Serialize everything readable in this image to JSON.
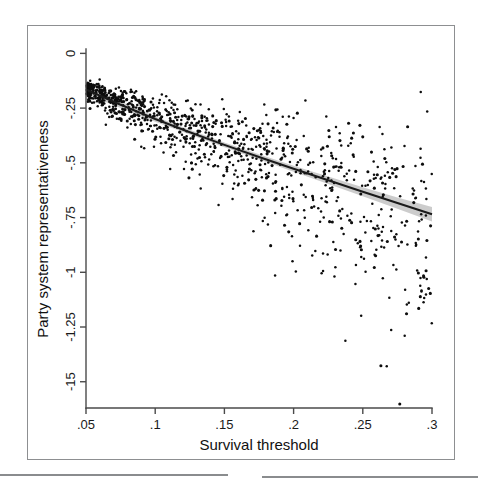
{
  "figure": {
    "kind": "scatterplot-with-fit",
    "background_color": "#ffffff",
    "frame_color": "#8d8f91",
    "point_color": "#0d0d0d",
    "fit_line_color": "#1b1b1b",
    "ci_band_color": "#b9b9b9"
  },
  "chart_data": {
    "type": "scatter",
    "title": "",
    "xlabel": "Survival threshold",
    "ylabel": "Party system representativeness",
    "xlim": [
      0.05,
      0.3
    ],
    "ylim": [
      -1.62,
      0.02
    ],
    "grid": false,
    "legend": "none",
    "xticks": [
      0.05,
      0.1,
      0.15,
      0.2,
      0.25,
      0.3
    ],
    "xticklabels": [
      ".05",
      ".1",
      ".15",
      ".2",
      ".25",
      ".3"
    ],
    "yticks": [
      0,
      -0.25,
      -0.5,
      -0.75,
      -1,
      -1.25,
      -1.5
    ],
    "yticklabels": [
      "0",
      "-.25",
      "-.5",
      "-.75",
      "-1",
      "-1.25",
      "-15"
    ],
    "n_points": 1050,
    "series": [
      {
        "name": "observations",
        "marker": "dot",
        "color": "#0d0d0d",
        "description": "Dense cloud of country-election observations; tight near x=.05 around y=-.15, fanning out downward as x increases."
      },
      {
        "name": "fitted line",
        "type": "line",
        "color": "#1b1b1b",
        "description": "Monotonically decreasing fit with 95% confidence band.",
        "x": [
          0.05,
          0.075,
          0.1,
          0.125,
          0.15,
          0.175,
          0.2,
          0.225,
          0.25,
          0.275,
          0.3
        ],
        "y": [
          -0.165,
          -0.235,
          -0.3,
          -0.36,
          -0.418,
          -0.473,
          -0.527,
          -0.58,
          -0.632,
          -0.684,
          -0.735
        ],
        "ci_lower": [
          -0.185,
          -0.25,
          -0.312,
          -0.371,
          -0.429,
          -0.485,
          -0.541,
          -0.597,
          -0.653,
          -0.71,
          -0.768
        ],
        "ci_upper": [
          -0.145,
          -0.22,
          -0.288,
          -0.349,
          -0.407,
          -0.461,
          -0.513,
          -0.563,
          -0.611,
          -0.658,
          -0.702
        ]
      }
    ]
  },
  "neighbors": {
    "left_rule_label": "adjacent-figure-top-edge",
    "right_rule_label": "adjacent-figure-top-edge"
  }
}
